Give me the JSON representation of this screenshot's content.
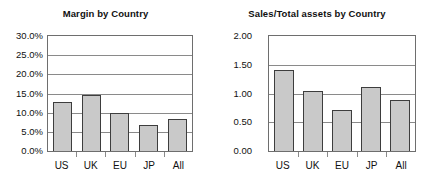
{
  "figure": {
    "background": "#ffffff",
    "bar_fill": "#c9c9c9",
    "bar_border": "#3d3d3d",
    "grid_color": "#8a8a8a",
    "frame_color": "#6e6e6e"
  },
  "panels": [
    {
      "id": "margin",
      "title": "Margin by Country",
      "ytick_labels": [
        "30.0%",
        "25.0%",
        "20.0%",
        "15.0%",
        "10.0%",
        "5.0%",
        "0.0%"
      ],
      "xtick_labels": [
        "US",
        "UK",
        "EU",
        "JP",
        "All"
      ]
    },
    {
      "id": "sales",
      "title": "Sales/Total assets by Country",
      "ytick_labels": [
        "2.00",
        "1.50",
        "1.00",
        "0.50",
        "0.00"
      ],
      "xtick_labels": [
        "US",
        "UK",
        "EU",
        "JP",
        "All"
      ]
    }
  ],
  "chart_data": [
    {
      "type": "bar",
      "title": "Margin by Country",
      "xlabel": "",
      "ylabel": "",
      "categories": [
        "US",
        "UK",
        "EU",
        "JP",
        "All"
      ],
      "values": [
        12.7,
        14.5,
        9.8,
        6.7,
        8.4
      ],
      "value_unit": "percent",
      "ylim": [
        0,
        30
      ],
      "ytick_values": [
        0,
        5,
        10,
        15,
        20,
        25,
        30
      ],
      "ytick_labels": [
        "0.0%",
        "5.0%",
        "10.0%",
        "15.0%",
        "20.0%",
        "25.0%",
        "30.0%"
      ],
      "grid": true,
      "grid_axis": "y",
      "legend": false
    },
    {
      "type": "bar",
      "title": "Sales/Total assets by Country",
      "xlabel": "",
      "ylabel": "",
      "categories": [
        "US",
        "UK",
        "EU",
        "JP",
        "All"
      ],
      "values": [
        1.41,
        1.04,
        0.71,
        1.12,
        0.89
      ],
      "value_unit": "ratio",
      "ylim": [
        0,
        2.0
      ],
      "ytick_values": [
        0.0,
        0.5,
        1.0,
        1.5,
        2.0
      ],
      "ytick_labels": [
        "0.00",
        "0.50",
        "1.00",
        "1.50",
        "2.00"
      ],
      "grid": true,
      "grid_axis": "y",
      "legend": false
    }
  ]
}
